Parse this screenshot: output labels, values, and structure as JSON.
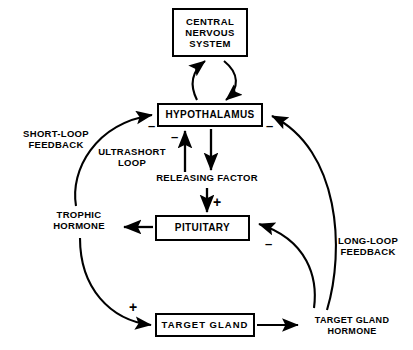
{
  "diagram": {
    "nodes": {
      "cns": "CENTRAL\nNERVOUS\nSYSTEM",
      "hypothalamus": "HYPOTHALAMUS",
      "pituitary": "PITUITARY",
      "target_gland": "TARGET GLAND"
    },
    "labels": {
      "short_loop": "SHORT-LOOP\nFEEDBACK",
      "ultrashort_loop": "ULTRASHORT\nLOOP",
      "releasing_factor": "RELEASING FACTOR",
      "trophic_hormone": "TROPHIC\nHORMONE",
      "long_loop": "LONG-LOOP\nFEEDBACK",
      "target_gland_hormone": "TARGET GLAND\nHORMONE"
    },
    "signs": {
      "ultrashort_negative": "–",
      "short_loop_negative": "–",
      "long_loop_hypothalamus_negative": "–",
      "long_loop_pituitary_negative": "–",
      "releasing_factor_positive": "+",
      "trophic_positive": "+"
    },
    "colors": {
      "ink": "#000000",
      "background": "#ffffff"
    }
  }
}
